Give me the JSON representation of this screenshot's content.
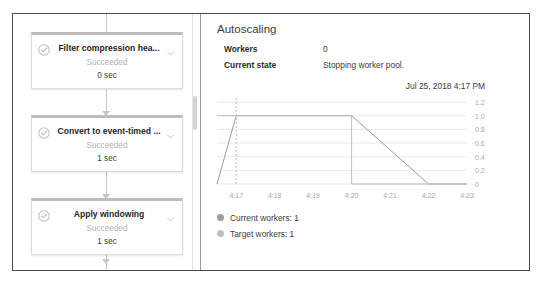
{
  "pipeline": {
    "steps": [
      {
        "title": "Filter compression hea...",
        "status": "Succeeded",
        "duration": "0 sec",
        "state_icon": "check-circle-icon",
        "expand_icon": "chevron-down-icon"
      },
      {
        "title": "Convert to event-timed ...",
        "status": "Succeeded",
        "duration": "1 sec",
        "state_icon": "check-circle-icon",
        "expand_icon": "chevron-down-icon"
      },
      {
        "title": "Apply windowing",
        "status": "Succeeded",
        "duration": "1 sec",
        "state_icon": "check-circle-icon",
        "expand_icon": "chevron-down-icon"
      }
    ]
  },
  "details": {
    "title": "Autoscaling",
    "rows": [
      {
        "key": "Workers",
        "value": "0"
      },
      {
        "key": "Current state",
        "value": "Stopping worker pool."
      }
    ],
    "timestamp": "Jul 25, 2018 4:17 PM"
  },
  "colors": {
    "frame_border": "#4a4a4a",
    "card_border": "#dcdcdc",
    "card_accent": "#bdbdbd",
    "muted_text": "#b4b4b4",
    "body_text": "#3c3c3c",
    "grid_line": "#e8e8e8",
    "series_current": "#9e9e9e",
    "series_target": "#bdbdbd",
    "cursor_line": "#c0c0c0"
  },
  "chart_data": {
    "type": "line",
    "title": "",
    "xlabel": "",
    "ylabel": "",
    "xtick_labels": [
      "4:17",
      "4:18",
      "4:19",
      "4:20",
      "4:21",
      "4:22",
      "4:23"
    ],
    "ytick_labels": [
      "1.2",
      "1.0",
      "0.8",
      "0.6",
      "0.4",
      "0.2",
      "0"
    ],
    "ylim": [
      0,
      1.2
    ],
    "yticks": [
      0,
      0.2,
      0.4,
      0.6,
      0.8,
      1.0,
      1.2
    ],
    "grid": true,
    "legend_position": "below",
    "cursor_x": "4:17",
    "series": [
      {
        "name": "Current workers: 1",
        "legend_label": "Current workers: 1",
        "current_value": 1,
        "color": "#9e9e9e",
        "points": [
          {
            "x": "4:16.5",
            "y": 0
          },
          {
            "x": "4:17",
            "y": 1
          },
          {
            "x": "4:20",
            "y": 1
          },
          {
            "x": "4:22",
            "y": 0
          },
          {
            "x": "4:23",
            "y": 0
          }
        ]
      },
      {
        "name": "Target workers: 1",
        "legend_label": "Target workers: 1",
        "current_value": 1,
        "color": "#bdbdbd",
        "points": [
          {
            "x": "4:16.5",
            "y": 1
          },
          {
            "x": "4:20",
            "y": 1
          },
          {
            "x": "4:20",
            "y": 0
          },
          {
            "x": "4:23",
            "y": 0
          }
        ]
      }
    ]
  }
}
